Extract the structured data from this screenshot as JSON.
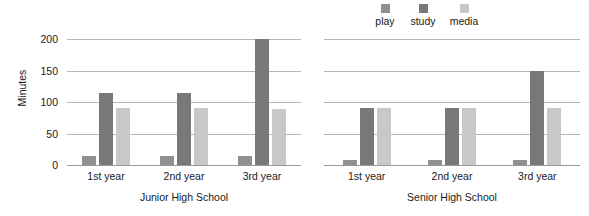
{
  "chart_data": {
    "type": "bar",
    "title": "",
    "subtitle": "",
    "xlabel": "",
    "ylabel": "Minutes",
    "ylim": [
      0,
      200
    ],
    "yticks": [
      0,
      50,
      100,
      150,
      200
    ],
    "ytick_labels": [
      "0",
      "50",
      "100",
      "150",
      "200"
    ],
    "grid": true,
    "legend_position": "top-right",
    "orientation": "vertical",
    "grouped": true,
    "panels": [
      {
        "name": "Junior High School",
        "categories": [
          "1st year",
          "2nd year",
          "3rd year"
        ],
        "series": [
          {
            "name": "play",
            "values": [
              15,
              14,
              14
            ]
          },
          {
            "name": "study",
            "values": [
              115,
              115,
              200
            ]
          },
          {
            "name": "media",
            "values": [
              90,
              90,
              89
            ]
          }
        ]
      },
      {
        "name": "Senior High School",
        "categories": [
          "1st year",
          "2nd year",
          "3rd year"
        ],
        "series": [
          {
            "name": "play",
            "values": [
              8,
              8,
              8
            ]
          },
          {
            "name": "study",
            "values": [
              90,
              90,
              150
            ]
          },
          {
            "name": "media",
            "values": [
              90,
              90,
              90
            ]
          }
        ]
      }
    ],
    "legend": [
      {
        "label": "play",
        "color": "#909090"
      },
      {
        "label": "study",
        "color": "#787878"
      },
      {
        "label": "media",
        "color": "#c8c8c8"
      }
    ],
    "colors": {
      "play": "#909090",
      "study": "#787878",
      "media": "#c8c8c8",
      "gridline": "#b6b6b6",
      "axis": "#9a9a9a",
      "text": "#1a1a1a",
      "background": "#ffffff"
    }
  }
}
